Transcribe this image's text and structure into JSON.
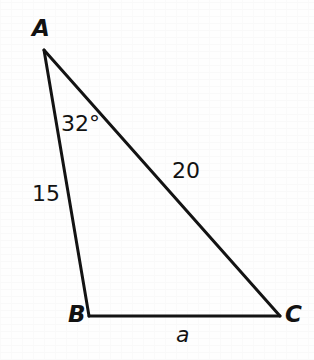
{
  "figure": {
    "kind": "geometry-triangle-diagram",
    "background_color": "#fefefe",
    "stroke_color": "#131313",
    "text_color": "#121212",
    "stroke_width": 3
  },
  "vertices": [
    {
      "name": "A",
      "label": "A",
      "x": 44,
      "y": 50
    },
    {
      "name": "B",
      "label": "B",
      "x": 89,
      "y": 316
    },
    {
      "name": "C",
      "label": "C",
      "x": 280,
      "y": 316
    }
  ],
  "angles": [
    {
      "at_vertex": "A",
      "label": "32°",
      "value": 32,
      "unit": "degrees"
    }
  ],
  "sides": [
    {
      "name": "AB",
      "label": "15",
      "value": 15,
      "opposite_vertex": "C",
      "known": true
    },
    {
      "name": "AC",
      "label": "20",
      "value": 20,
      "opposite_vertex": "B",
      "known": true
    },
    {
      "name": "BC",
      "label": "a",
      "value": null,
      "opposite_vertex": "A",
      "known": false
    }
  ]
}
